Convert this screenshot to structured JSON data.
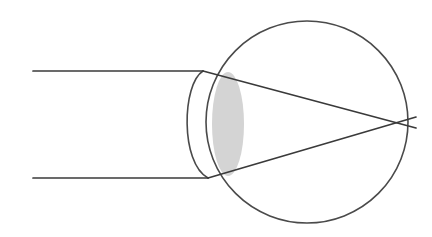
{
  "diagram": {
    "type": "optical-ray-diagram",
    "canvas": {
      "width": 432,
      "height": 237,
      "background": "#ffffff"
    },
    "colors": {
      "outline": "#4a4a4a",
      "ray": "#3a3a3a",
      "lens_fill": "#d4d4d4",
      "background": "#ffffff"
    },
    "parts": {
      "eyeball": {
        "name": "eyeball-globe",
        "shape": "circle",
        "cx": 307,
        "cy": 122,
        "r": 101,
        "stroke_width": 1.6
      },
      "cornea": {
        "name": "cornea-arc",
        "shape": "arc",
        "start": [
          203,
          71
        ],
        "end": [
          208,
          178
        ],
        "bulge_x": 186,
        "stroke_width": 1.6
      },
      "lens": {
        "name": "crystalline-lens",
        "shape": "biconvex-ellipse",
        "cx": 228,
        "cy": 124,
        "rx": 16,
        "ry": 52,
        "fill": "#d4d4d4"
      }
    },
    "rays": [
      {
        "name": "upper-light-ray",
        "incoming": {
          "x1": 33,
          "y1": 71,
          "x2": 203,
          "y2": 71
        },
        "refracted": {
          "x1": 203,
          "y1": 71,
          "x2": 416,
          "y2": 128
        }
      },
      {
        "name": "lower-light-ray",
        "incoming": {
          "x1": 33,
          "y1": 178,
          "x2": 208,
          "y2": 178
        },
        "refracted": {
          "x1": 208,
          "y1": 178,
          "x2": 416,
          "y2": 117
        }
      }
    ],
    "focal_point": {
      "name": "focal-crossing-point",
      "x": 393,
      "y": 122
    }
  }
}
